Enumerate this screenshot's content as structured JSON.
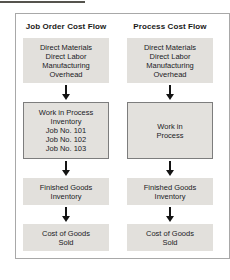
{
  "diagram": {
    "columns": [
      {
        "header": "Job Order Cost Flow",
        "boxes": [
          {
            "lines": [
              "Direct Materials",
              "Direct Labor",
              "Manufacturing",
              "Overhead"
            ]
          },
          {
            "lines": [
              "Work in Process",
              "Inventory",
              "Job No. 101",
              "Job No. 102",
              "Job No. 103"
            ],
            "bordered": true
          },
          {
            "lines": [
              "Finished Goods",
              "Inventory"
            ]
          },
          {
            "lines": [
              "Cost of Goods",
              "Sold"
            ]
          }
        ]
      },
      {
        "header": "Process Cost Flow",
        "boxes": [
          {
            "lines": [
              "Direct Materials",
              "Direct Labor",
              "Manufacturing",
              "Overhead"
            ]
          },
          {
            "lines": [
              "Work in",
              "Process"
            ],
            "bordered": true
          },
          {
            "lines": [
              "Finished Goods",
              "Inventory"
            ]
          },
          {
            "lines": [
              "Cost of Goods",
              "Sold"
            ]
          }
        ]
      }
    ],
    "colors": {
      "box_fill": "#e2e0dc",
      "wip_box_border": "#7d7d7d",
      "frame_border": "#a8a8a8",
      "arrow": "#141414",
      "text": "#21211f",
      "top_rule": "#55534d"
    }
  }
}
